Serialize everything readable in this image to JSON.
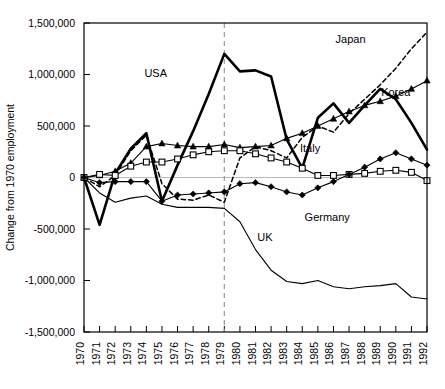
{
  "chart_data": {
    "type": "line",
    "title": "",
    "xlabel": "",
    "ylabel": "Change from 1970 employment",
    "ylim": [
      -1500000,
      1500000
    ],
    "yticks": [
      1500000,
      1000000,
      500000,
      0,
      -500000,
      -1000000,
      -1500000
    ],
    "ytick_labels": [
      "1,500,000",
      "1,000,000",
      "500,000",
      "0",
      "-500,000",
      "-1,000,000",
      "-1,500,000"
    ],
    "x": [
      1970,
      1971,
      1972,
      1973,
      1974,
      1975,
      1976,
      1977,
      1978,
      1979,
      1980,
      1981,
      1982,
      1983,
      1984,
      1985,
      1986,
      1987,
      1988,
      1989,
      1990,
      1991,
      1992
    ],
    "xtick_labels": [
      "1970",
      "1971",
      "1972",
      "1973",
      "1974",
      "1975",
      "1976",
      "1977",
      "1978",
      "1979",
      "1980",
      "1981",
      "1982",
      "1983",
      "1984",
      "1985",
      "1986",
      "1987",
      "1988",
      "1989",
      "1990",
      "1991",
      "1992"
    ],
    "grid": false,
    "legend": "inline-annotations",
    "annotation_line": {
      "x": 1979,
      "style": "dashed",
      "color": "#999999"
    },
    "zero_line": {
      "y": 0,
      "color": "#bbbbbb"
    },
    "series": [
      {
        "name": "USA",
        "style": "solid-thick",
        "marker": "none",
        "color": "#000000",
        "values": [
          0,
          -460000,
          40000,
          280000,
          430000,
          -230000,
          120000,
          450000,
          810000,
          1200000,
          1030000,
          1040000,
          980000,
          370000,
          90000,
          580000,
          720000,
          530000,
          700000,
          860000,
          760000,
          530000,
          270000
        ]
      },
      {
        "name": "Korea",
        "style": "solid-thin",
        "marker": "triangle-filled",
        "color": "#000000",
        "values": [
          0,
          20000,
          60000,
          140000,
          300000,
          330000,
          310000,
          300000,
          300000,
          320000,
          290000,
          300000,
          310000,
          380000,
          430000,
          500000,
          570000,
          640000,
          700000,
          740000,
          790000,
          860000,
          940000
        ]
      },
      {
        "name": "Japan",
        "style": "dashed",
        "marker": "none",
        "color": "#000000",
        "values": [
          0,
          -90000,
          20000,
          260000,
          410000,
          -60000,
          -210000,
          -220000,
          -170000,
          -240000,
          190000,
          300000,
          260000,
          190000,
          390000,
          500000,
          440000,
          620000,
          760000,
          900000,
          1060000,
          1250000,
          1410000
        ]
      },
      {
        "name": "Italy",
        "style": "solid-thin",
        "marker": "square-open",
        "color": "#000000",
        "values": [
          0,
          30000,
          20000,
          110000,
          150000,
          150000,
          180000,
          220000,
          250000,
          260000,
          260000,
          230000,
          190000,
          150000,
          90000,
          20000,
          20000,
          30000,
          40000,
          60000,
          70000,
          50000,
          -30000
        ]
      },
      {
        "name": "Germany",
        "style": "solid-thin",
        "marker": "diamond-filled",
        "color": "#000000",
        "values": [
          0,
          -50000,
          -40000,
          -40000,
          -40000,
          -230000,
          -170000,
          -160000,
          -150000,
          -140000,
          -60000,
          -50000,
          -90000,
          -140000,
          -170000,
          -100000,
          -40000,
          30000,
          100000,
          180000,
          240000,
          180000,
          120000
        ]
      },
      {
        "name": "UK",
        "style": "solid-thin",
        "marker": "none",
        "color": "#000000",
        "values": [
          0,
          -150000,
          -240000,
          -200000,
          -180000,
          -260000,
          -290000,
          -290000,
          -290000,
          -300000,
          -430000,
          -700000,
          -900000,
          -1010000,
          -1030000,
          -1000000,
          -1060000,
          -1080000,
          -1060000,
          -1050000,
          -1030000,
          -1160000,
          -1180000
        ]
      }
    ],
    "annotations": [
      {
        "text": "USA",
        "x": 1974.6,
        "y": 980000
      },
      {
        "text": "Japan",
        "x": 1987.1,
        "y": 1310000
      },
      {
        "text": "Korea",
        "x": 1990.0,
        "y": 790000
      },
      {
        "text": "Italy",
        "x": 1984.5,
        "y": 250000
      },
      {
        "text": "Germany",
        "x": 1985.6,
        "y": -420000
      },
      {
        "text": "UK",
        "x": 1981.6,
        "y": -620000
      }
    ]
  }
}
